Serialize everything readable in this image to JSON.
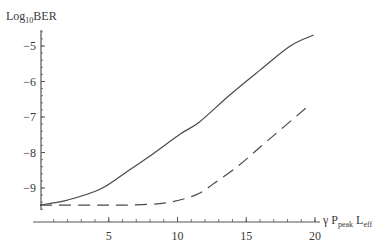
{
  "chart_data": {
    "type": "line",
    "title": "",
    "xlabel": "γ P_peak L_eff",
    "xlabel_parts": {
      "main1": "γ P",
      "sub1": "peak",
      "main2": " L",
      "sub2": "eff"
    },
    "ylabel": "Log10BER",
    "ylabel_parts": {
      "main1": "Log",
      "sub1": "10",
      "main2": "BER"
    },
    "xlim": [
      0,
      20.5
    ],
    "ylim": [
      -9.8,
      -4.5
    ],
    "x_ticks": [
      5,
      10,
      15,
      20
    ],
    "x_tick_labels": [
      "5",
      "10",
      "15",
      "20"
    ],
    "y_ticks": [
      -5,
      -6,
      -7,
      -8,
      -9
    ],
    "y_tick_labels": [
      "-5",
      "-6",
      "-7",
      "-8",
      "-9"
    ],
    "grid": false,
    "legend": null,
    "series": [
      {
        "name": "solid",
        "style": "solid",
        "x": [
          0,
          2,
          4.4,
          6.5,
          8,
          10.2,
          11.6,
          13.8,
          16,
          18.2,
          19.9
        ],
        "values": [
          -9.48,
          -9.34,
          -9.03,
          -8.49,
          -8.1,
          -7.48,
          -7.14,
          -6.38,
          -5.68,
          -5.0,
          -4.69
        ]
      },
      {
        "name": "dashed",
        "style": "dashed",
        "x": [
          0,
          4.4,
          6.5,
          9.1,
          11.3,
          12.7,
          14.5,
          16,
          19.7
        ],
        "values": [
          -9.48,
          -9.48,
          -9.48,
          -9.42,
          -9.2,
          -8.86,
          -8.35,
          -7.85,
          -6.63
        ]
      }
    ]
  }
}
